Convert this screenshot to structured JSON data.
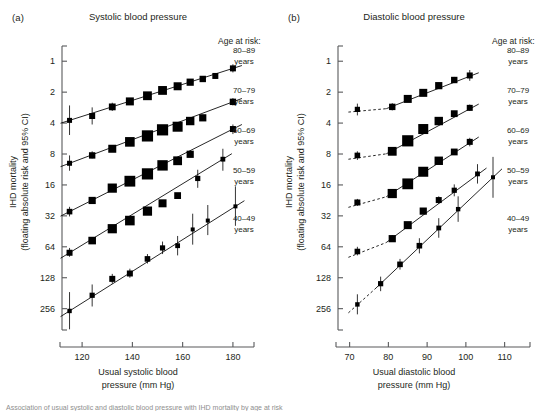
{
  "figure": {
    "caption_partial": "Association of usual systolic and diastolic blood pressure with IHD mortality by age at risk"
  },
  "panels": [
    {
      "tag": "(a)",
      "title": "Systolic blood pressure",
      "ylabel_line1": "IHD mortality",
      "ylabel_line2": "(floating absolute risk and 95% CI)",
      "xlabel_line1": "Usual systolic blood",
      "xlabel_line2": "pressure (mm Hg)",
      "legend_title": "Age at risk:",
      "yticks": [
        "256",
        "128",
        "64",
        "32",
        "16",
        "8",
        "4",
        "2",
        "1"
      ],
      "xticks": [
        "120",
        "140",
        "160",
        "180"
      ]
    },
    {
      "tag": "(b)",
      "title": "Diastolic blood pressure",
      "ylabel_line1": "IHD mortality",
      "ylabel_line2": "(floating absolute risk and 95% CI)",
      "xlabel_line1": "Usual diastolic blood",
      "xlabel_line2": "pressure (mm Hg)",
      "legend_title": "Age at risk:",
      "yticks": [
        "256",
        "128",
        "64",
        "32",
        "16",
        "8",
        "4",
        "2",
        "1"
      ],
      "xticks": [
        "70",
        "80",
        "90",
        "100",
        "110"
      ]
    }
  ],
  "legend_entries": [
    {
      "range": "80–89",
      "unit": "years"
    },
    {
      "range": "70–79",
      "unit": "years"
    },
    {
      "range": "60–69",
      "unit": "years"
    },
    {
      "range": "50–59",
      "unit": "years"
    },
    {
      "range": "40–49",
      "unit": "years"
    }
  ],
  "chart_data": [
    {
      "type": "scatter",
      "panel": "a",
      "title": "Systolic blood pressure",
      "xlabel": "Usual systolic blood pressure (mm Hg)",
      "ylabel": "IHD mortality (floating absolute risk and 95% CI)",
      "xlim": [
        112,
        186
      ],
      "ylim": [
        0.62,
        360
      ],
      "yscale": "log2",
      "yticks": [
        1,
        2,
        4,
        8,
        16,
        32,
        64,
        128,
        256
      ],
      "xticks": [
        120,
        140,
        160,
        180
      ],
      "grid": false,
      "legend_position": "right",
      "series": [
        {
          "name": "80–89 years",
          "x": [
            115,
            124,
            132,
            139,
            146,
            152,
            158,
            163,
            168,
            173,
            180
          ],
          "y": [
            68,
            75,
            92,
            104,
            118,
            133,
            146,
            160,
            172,
            184,
            218
          ],
          "ci_low": [
            49,
            62,
            84,
            97,
            111,
            126,
            139,
            152,
            163,
            173,
            199
          ],
          "ci_high": [
            95,
            91,
            101,
            112,
            126,
            141,
            154,
            169,
            182,
            196,
            239
          ],
          "marker_sizes": [
            2.5,
            3.0,
            3.4,
            4.0,
            4.4,
            4.4,
            4.0,
            3.6,
            3.2,
            3.0,
            3.0
          ]
        },
        {
          "name": "70–79 years",
          "x": [
            115,
            124,
            132,
            139,
            146,
            152,
            158,
            163,
            168,
            180
          ],
          "y": [
            26,
            31,
            36,
            42,
            48,
            55,
            59,
            67,
            72,
            103
          ],
          "ci_low": [
            22,
            29,
            34,
            40,
            46,
            53,
            57,
            64,
            68,
            95
          ],
          "ci_high": [
            31,
            34,
            39,
            45,
            51,
            58,
            62,
            71,
            77,
            112
          ],
          "marker_sizes": [
            2.5,
            3.2,
            4.0,
            4.8,
            5.6,
            5.6,
            5.0,
            4.2,
            3.6,
            3.2
          ]
        },
        {
          "name": "60–69 years",
          "x": [
            115,
            124,
            132,
            139,
            146,
            152,
            158,
            163,
            180
          ],
          "y": [
            8.8,
            11.3,
            14.9,
            17.4,
            20.5,
            24.8,
            27.5,
            31.8,
            56
          ],
          "ci_low": [
            7.9,
            10.6,
            14.1,
            16.6,
            19.5,
            23.6,
            26.2,
            29.8,
            50
          ],
          "ci_high": [
            9.8,
            12.0,
            15.7,
            18.3,
            21.6,
            26.0,
            28.9,
            34.0,
            62
          ],
          "marker_sizes": [
            2.8,
            3.6,
            4.6,
            5.4,
            5.6,
            5.2,
            4.4,
            3.6,
            3.0
          ]
        },
        {
          "name": "50–59 years",
          "x": [
            115,
            124,
            132,
            139,
            146,
            152,
            158,
            166,
            176
          ],
          "y": [
            3.5,
            4.6,
            6.0,
            7.2,
            8.9,
            10.6,
            12.6,
            18.5,
            28.5
          ],
          "ci_low": [
            3.2,
            4.3,
            5.7,
            6.9,
            8.5,
            10.1,
            12.0,
            15.0,
            22.0
          ],
          "ci_high": [
            3.9,
            4.9,
            6.3,
            7.6,
            9.4,
            11.2,
            13.3,
            22.5,
            36.0
          ],
          "marker_sizes": [
            3.0,
            3.8,
            4.6,
            4.8,
            4.6,
            4.0,
            3.4,
            2.6,
            2.4
          ]
        },
        {
          "name": "40–49 years",
          "x": [
            115,
            124,
            132,
            139,
            146,
            152,
            158,
            164,
            170,
            181
          ],
          "y": [
            0.95,
            1.35,
            1.95,
            2.2,
            3.05,
            3.9,
            4.1,
            5.9,
            7.2,
            9.9
          ],
          "ci_low": [
            0.63,
            1.05,
            1.75,
            2.0,
            2.75,
            3.4,
            3.3,
            4.2,
            5.2,
            6.4
          ],
          "ci_high": [
            1.45,
            1.72,
            2.18,
            2.45,
            3.4,
            4.5,
            5.1,
            8.4,
            10.2,
            15.5
          ],
          "marker_sizes": [
            2.2,
            2.6,
            3.0,
            3.0,
            2.8,
            2.6,
            2.4,
            2.0,
            2.0,
            2.0
          ]
        }
      ]
    },
    {
      "type": "scatter",
      "panel": "b",
      "title": "Diastolic blood pressure",
      "xlabel": "Usual diastolic blood pressure (mm Hg)",
      "ylabel": "IHD mortality (floating absolute risk and 95% CI)",
      "xlim": [
        67,
        115
      ],
      "ylim": [
        0.62,
        360
      ],
      "yscale": "log2",
      "yticks": [
        1,
        2,
        4,
        8,
        16,
        32,
        64,
        128,
        256
      ],
      "xticks": [
        70,
        80,
        90,
        100,
        110
      ],
      "grid": false,
      "legend_position": "right",
      "series": [
        {
          "name": "80–89 years",
          "x": [
            72,
            81,
            85,
            89,
            93,
            97,
            101
          ],
          "y": [
            87,
            92,
            110,
            126,
            148,
            168,
            186
          ],
          "ci_low": [
            76,
            85,
            103,
            119,
            139,
            157,
            165
          ],
          "ci_high": [
            99,
            100,
            118,
            134,
            158,
            180,
            210
          ],
          "marker_sizes": [
            2.6,
            3.2,
            4.0,
            4.0,
            3.6,
            3.2,
            3.0
          ],
          "dashed_extension": true
        },
        {
          "name": "70–79 years",
          "x": [
            72,
            81,
            85,
            89,
            93,
            97,
            101
          ],
          "y": [
            31,
            34,
            43,
            56,
            67,
            79,
            90
          ],
          "ci_low": [
            28,
            32,
            41,
            53,
            64,
            75,
            84
          ],
          "ci_high": [
            34,
            37,
            46,
            59,
            71,
            84,
            97
          ],
          "marker_sizes": [
            2.8,
            4.4,
            5.6,
            5.0,
            4.2,
            3.4,
            3.0
          ],
          "dashed_extension": true
        },
        {
          "name": "60–69 years",
          "x": [
            72,
            81,
            85,
            89,
            93,
            97,
            101
          ],
          "y": [
            10.8,
            13.2,
            16.4,
            21.5,
            27.5,
            33.5,
            42
          ],
          "ci_low": [
            10.0,
            12.5,
            15.6,
            20.4,
            26.0,
            31.5,
            38
          ],
          "ci_high": [
            11.7,
            14.0,
            17.3,
            22.7,
            29.2,
            35.6,
            46
          ],
          "marker_sizes": [
            3.0,
            4.6,
            5.4,
            5.0,
            4.2,
            3.4,
            3.0
          ],
          "dashed_extension": true
        },
        {
          "name": "50–59 years",
          "x": [
            72,
            81,
            85,
            89,
            93,
            97,
            103
          ],
          "y": [
            3.6,
            4.8,
            6.5,
            8.9,
            11.4,
            14.2,
            20.5
          ],
          "ci_low": [
            3.3,
            4.5,
            6.1,
            8.3,
            10.5,
            12.4,
            16.5
          ],
          "ci_high": [
            4.0,
            5.2,
            6.9,
            9.5,
            12.4,
            16.2,
            25.5
          ],
          "marker_sizes": [
            2.8,
            3.6,
            4.0,
            3.6,
            3.0,
            2.6,
            2.4
          ],
          "dashed_extension": true
        },
        {
          "name": "40–49 years",
          "x": [
            72,
            78,
            83,
            88,
            93,
            98,
            107
          ],
          "y": [
            1.1,
            1.75,
            2.7,
            4.1,
            6.1,
            9.3,
            19.0
          ],
          "ci_low": [
            0.88,
            1.48,
            2.4,
            3.45,
            4.9,
            7.0,
            12.0
          ],
          "ci_high": [
            1.38,
            2.05,
            3.05,
            4.85,
            7.6,
            12.4,
            30.0
          ],
          "marker_sizes": [
            2.2,
            2.6,
            2.8,
            2.8,
            2.4,
            2.2,
            2.0
          ],
          "dashed_extension": true
        }
      ]
    }
  ]
}
